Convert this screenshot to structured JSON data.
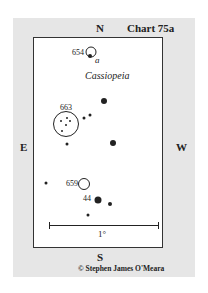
{
  "chart": {
    "title": "Chart 75a",
    "constellation": "Cassiopeia",
    "directions": {
      "north": "N",
      "south": "S",
      "east": "E",
      "west": "W"
    },
    "scale_label": "1°",
    "credit": "© Stephen James O'Meara"
  },
  "objects": [
    {
      "id": "654",
      "label": "654",
      "type": "cluster-circle"
    },
    {
      "id": "alpha",
      "label": "a",
      "type": "star-designation"
    },
    {
      "id": "663",
      "label": "663",
      "type": "cluster-circle"
    },
    {
      "id": "659",
      "label": "659",
      "type": "cluster-circle"
    },
    {
      "id": "44",
      "label": "44",
      "type": "star-designation"
    }
  ],
  "colors": {
    "panel": "#e6e6e6",
    "field": "#ffffff",
    "ink": "#222222"
  }
}
